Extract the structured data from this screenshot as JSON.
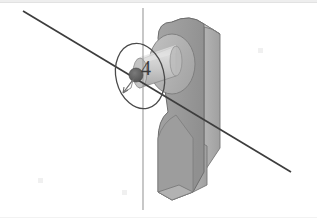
{
  "app": {
    "title": "3D CAD Viewport",
    "background_color": "#ffffff",
    "border_color": "#e2e2e2"
  },
  "annotation": {
    "label": "4",
    "label_color": "#3c3c3c",
    "selection_ellipse_color": "#4a4a4a",
    "point_marker_color": "#555555",
    "arrow_color": "#6a6a6a"
  },
  "axes": {
    "vertical_axis": {
      "name": "vertical-axis-line",
      "color": "#9a9a9a",
      "x": 143,
      "y_start": 8,
      "y_end": 210
    },
    "diagonal_axis": {
      "name": "diagonal-axis-line",
      "color": "#404040",
      "x_start": 23,
      "y_start": 11,
      "x_end": 291,
      "y_end": 172
    }
  },
  "model": {
    "name": "clevis-bracket",
    "colors": {
      "front_face": "#9a9a9a",
      "right_face": "#a8a8a8",
      "top_highlight": "#e0e0e0",
      "cylinder_light": "#d2d2d2",
      "cylinder_mid": "#bdbdbd",
      "cylinder_dark": "#a0a0a0",
      "boss_face": "#b5b5b5",
      "outline": "#6e6e6e"
    },
    "features": [
      "rounded-top-boss",
      "cylindrical-shaft",
      "tapered-neck",
      "rectangular-leg"
    ]
  }
}
